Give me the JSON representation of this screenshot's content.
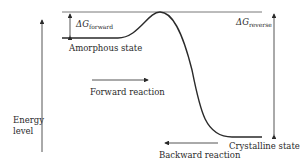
{
  "diagram": {
    "axis_label_line1": "Energy",
    "axis_label_line2": "level",
    "delta_forward": {
      "symbol": "ΔG",
      "subscript": "forward"
    },
    "delta_reverse": {
      "symbol": "ΔG",
      "subscript": "reverse"
    },
    "state_high": "Amorphous state",
    "state_low": "Crystalline state",
    "forward_label": "Forward reaction",
    "backward_label": "Backward reaction",
    "line_color": "#2a2a2a"
  }
}
